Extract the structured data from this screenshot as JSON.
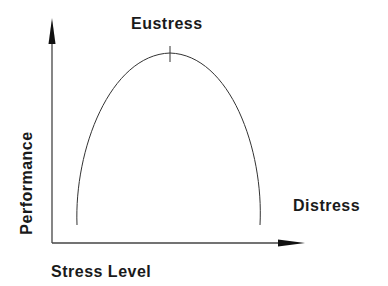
{
  "diagram": {
    "type": "inverted-u-curve",
    "peak_label": "Eustress",
    "right_label": "Distress",
    "x_axis_label": "Stress Level",
    "y_axis_label": "Performance",
    "colors": {
      "line": "#333333",
      "axis": "#333333",
      "text": "#1a1a1a",
      "background": "#ffffff"
    }
  }
}
